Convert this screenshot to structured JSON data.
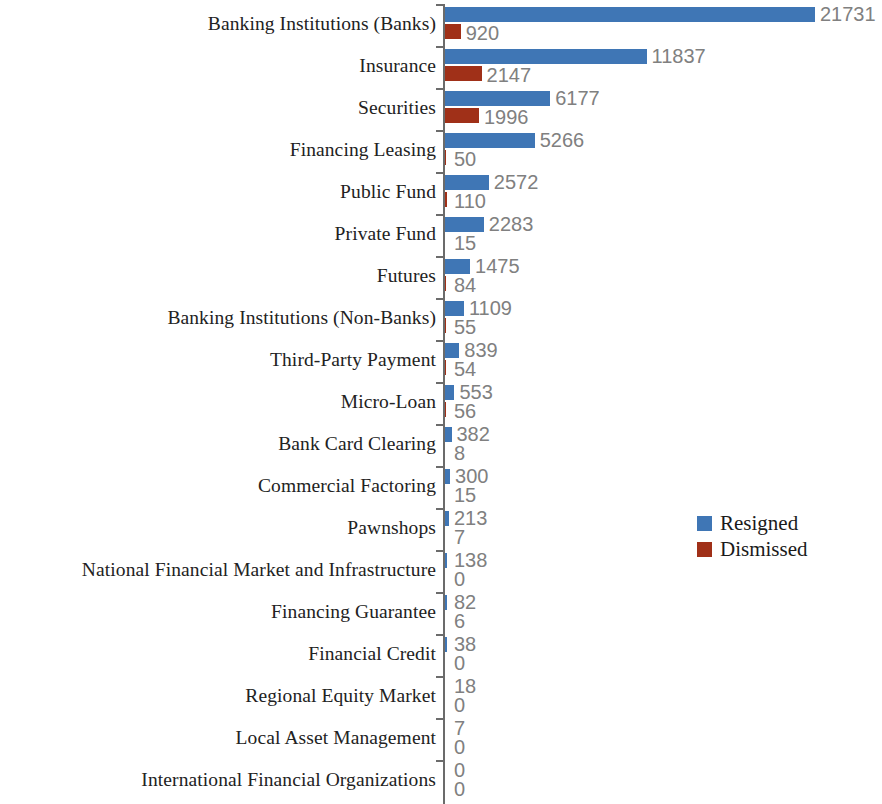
{
  "chart_data": {
    "type": "bar",
    "orientation": "horizontal",
    "title": "",
    "subtitle": "",
    "xlabel": "",
    "ylabel": "",
    "grid": false,
    "legend_position": "center-right",
    "xlim": [
      0,
      21731
    ],
    "categories": [
      "Banking Institutions (Banks)",
      "Insurance",
      "Securities",
      "Financing Leasing",
      "Public Fund",
      "Private Fund",
      "Futures",
      "Banking Institutions (Non-Banks)",
      "Third-Party Payment",
      "Micro-Loan",
      "Bank Card Clearing",
      "Commercial Factoring",
      "Pawnshops",
      "National Financial Market and Infrastructure",
      "Financing Guarantee",
      "Financial Credit",
      "Regional Equity Market",
      "Local Asset Management",
      "International Financial Organizations"
    ],
    "series": [
      {
        "name": "Resigned",
        "color": "#3f76b5",
        "values": [
          21731,
          11837,
          6177,
          5266,
          2572,
          2283,
          1475,
          1109,
          839,
          553,
          382,
          300,
          213,
          138,
          82,
          38,
          18,
          7,
          0
        ]
      },
      {
        "name": "Dismissed",
        "color": "#a03018",
        "values": [
          920,
          2147,
          1996,
          50,
          110,
          15,
          84,
          55,
          54,
          56,
          8,
          15,
          7,
          0,
          6,
          0,
          0,
          0,
          0
        ]
      }
    ]
  },
  "legend": {
    "items": [
      {
        "label": "Resigned",
        "color": "#3f76b5"
      },
      {
        "label": "Dismissed",
        "color": "#a03018"
      }
    ]
  }
}
